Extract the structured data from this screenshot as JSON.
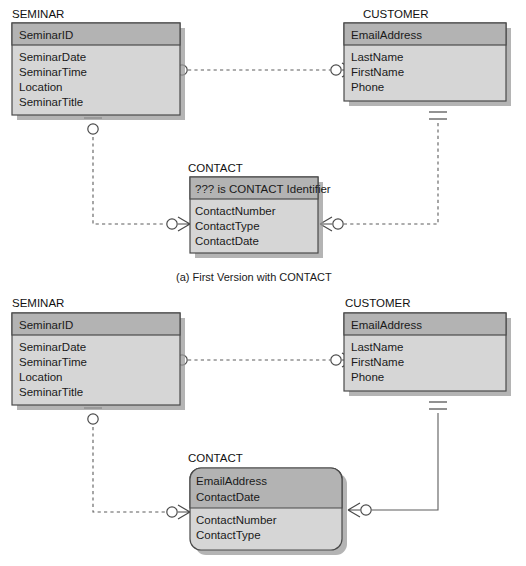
{
  "figure": {
    "background_color": "#ffffff",
    "entity_header_color": "#b3b3b3",
    "entity_body_color": "#d6d6d6",
    "entity_border_color": "#4a4a4a",
    "connector_color": "#5d5d5d"
  },
  "diagrams": [
    {
      "id": "diagram-a",
      "caption": "(a) First Version with CONTACT",
      "entities": [
        {
          "id": "seminar-a",
          "name": "SEMINAR",
          "shape": "rectangle",
          "identifier": "SeminarID",
          "identifier_note": "",
          "attributes": [
            "SeminarDate",
            "SeminarTime",
            "Location",
            "SeminarTitle"
          ]
        },
        {
          "id": "customer-a",
          "name": "CUSTOMER",
          "shape": "rectangle",
          "identifier": "EmailAddress",
          "identifier_note": "",
          "attributes": [
            "LastName",
            "FirstName",
            "Phone"
          ]
        },
        {
          "id": "contact-a",
          "name": "CONTACT",
          "shape": "rectangle",
          "identifier": "??? is CONTACT Identifier",
          "identifier_note": "??? is CONTACT Identifier",
          "attributes": [
            "ContactNumber",
            "ContactType",
            "ContactDate"
          ]
        }
      ],
      "relationships": [
        {
          "id": "rel-a-seminar-customer",
          "from": "SEMINAR",
          "to": "CUSTOMER",
          "line_style": "dashed",
          "from_cardinality": "optional-many",
          "to_cardinality": "optional-many"
        },
        {
          "id": "rel-a-seminar-contact",
          "from": "SEMINAR",
          "to": "CONTACT",
          "line_style": "dashed",
          "from_cardinality": "optional-one",
          "to_cardinality": "optional-many"
        },
        {
          "id": "rel-a-customer-contact",
          "from": "CUSTOMER",
          "to": "CONTACT",
          "line_style": "dashed",
          "from_cardinality": "mandatory-one",
          "to_cardinality": "optional-many"
        }
      ]
    },
    {
      "id": "diagram-b",
      "caption": "",
      "entities": [
        {
          "id": "seminar-b",
          "name": "SEMINAR",
          "shape": "rectangle",
          "identifier": "SeminarID",
          "identifier_note": "",
          "attributes": [
            "SeminarDate",
            "SeminarTime",
            "Location",
            "SeminarTitle"
          ]
        },
        {
          "id": "customer-b",
          "name": "CUSTOMER",
          "shape": "rectangle",
          "identifier": "EmailAddress",
          "identifier_note": "",
          "attributes": [
            "LastName",
            "FirstName",
            "Phone"
          ]
        },
        {
          "id": "contact-b",
          "name": "CONTACT",
          "shape": "rounded-rectangle",
          "identifier": "EmailAddress",
          "identifier_2": "ContactDate",
          "identifier_note": "",
          "attributes": [
            "ContactNumber",
            "ContactType"
          ]
        }
      ],
      "relationships": [
        {
          "id": "rel-b-seminar-customer",
          "from": "SEMINAR",
          "to": "CUSTOMER",
          "line_style": "dashed",
          "from_cardinality": "optional-many",
          "to_cardinality": "optional-many"
        },
        {
          "id": "rel-b-seminar-contact",
          "from": "SEMINAR",
          "to": "CONTACT",
          "line_style": "dashed",
          "from_cardinality": "optional-one",
          "to_cardinality": "optional-many"
        },
        {
          "id": "rel-b-customer-contact",
          "from": "CUSTOMER",
          "to": "CONTACT",
          "line_style": "solid",
          "from_cardinality": "mandatory-one",
          "to_cardinality": "optional-many"
        }
      ]
    }
  ],
  "labels": {
    "seminar_a_name": "SEMINAR",
    "seminar_a_id": "SeminarID",
    "seminar_a_attr_1": "SeminarDate",
    "seminar_a_attr_2": "SeminarTime",
    "seminar_a_attr_3": "Location",
    "seminar_a_attr_4": "SeminarTitle",
    "customer_a_name": "CUSTOMER",
    "customer_a_id": "EmailAddress",
    "customer_a_attr_1": "LastName",
    "customer_a_attr_2": "FirstName",
    "customer_a_attr_3": "Phone",
    "contact_a_name": "CONTACT",
    "contact_a_id": "??? is CONTACT Identifier",
    "contact_a_attr_1": "ContactNumber",
    "contact_a_attr_2": "ContactType",
    "contact_a_attr_3": "ContactDate",
    "caption_a": "(a) First Version with CONTACT",
    "seminar_b_name": "SEMINAR",
    "seminar_b_id": "SeminarID",
    "seminar_b_attr_1": "SeminarDate",
    "seminar_b_attr_2": "SeminarTime",
    "seminar_b_attr_3": "Location",
    "seminar_b_attr_4": "SeminarTitle",
    "customer_b_name": "CUSTOMER",
    "customer_b_id": "EmailAddress",
    "customer_b_attr_1": "LastName",
    "customer_b_attr_2": "FirstName",
    "customer_b_attr_3": "Phone",
    "contact_b_name": "CONTACT",
    "contact_b_id_1": "EmailAddress",
    "contact_b_id_2": "ContactDate",
    "contact_b_attr_1": "ContactNumber",
    "contact_b_attr_2": "ContactType"
  }
}
